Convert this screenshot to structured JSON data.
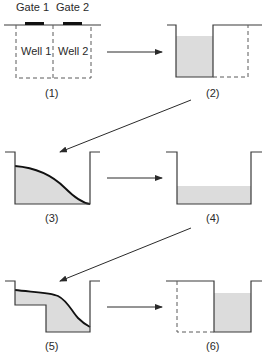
{
  "diagram": {
    "panel1": {
      "gate1_label": "Gate 1",
      "gate2_label": "Gate 2",
      "well1_label": "Well 1",
      "well2_label": "Well 2",
      "caption": "(1)"
    },
    "panel2": {
      "caption": "(2)"
    },
    "panel3": {
      "caption": "(3)"
    },
    "panel4": {
      "caption": "(4)"
    },
    "panel5": {
      "caption": "(5)"
    },
    "panel6": {
      "caption": "(6)"
    }
  },
  "colors": {
    "charge_fill": "#dcdcdc",
    "line": "#3a3a3a",
    "gate": "#111111"
  }
}
